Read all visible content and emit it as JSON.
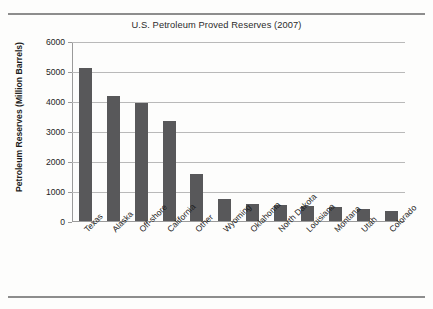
{
  "chart_data": {
    "type": "bar",
    "title": "U.S. Petroleum Proved Reserves (2007)",
    "xlabel": "",
    "ylabel": "Petroleum Reserves (Million Barrels)",
    "categories": [
      "Texas",
      "Alaska",
      "Off-shore",
      "California",
      "Other",
      "Wyoming",
      "Oklahoma",
      "North Dakota",
      "Louisiana",
      "Montana",
      "Utah",
      "Colorado"
    ],
    "values": [
      5100,
      4170,
      3920,
      3330,
      1580,
      730,
      570,
      530,
      500,
      460,
      400,
      350
    ],
    "ylim": [
      0,
      6000
    ],
    "yticks": [
      0,
      1000,
      2000,
      3000,
      4000,
      5000,
      6000
    ],
    "ytick_labels": [
      "0",
      "1000",
      "2000",
      "3000",
      "4000",
      "5000",
      "6000"
    ],
    "grid": true,
    "legend": false,
    "bar_color": "#58585a",
    "gridline_color": "#b9b9b9",
    "axis_color": "#9a9a9a",
    "background_color": "#fdfdfc"
  }
}
